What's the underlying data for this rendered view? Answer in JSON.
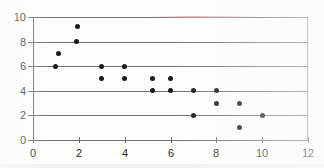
{
  "chart_data": {
    "type": "scatter",
    "title": "",
    "subtitle": "",
    "xlabel": "",
    "ylabel": "",
    "xlim": [
      0,
      12
    ],
    "ylim": [
      0,
      10
    ],
    "grid": true,
    "legend": null,
    "x_ticks": [
      0,
      2,
      4,
      6,
      8,
      10,
      12
    ],
    "y_ticks": [
      0,
      2,
      4,
      6,
      8,
      10
    ],
    "x_tick_labels": [
      "0",
      "2",
      "4",
      "6",
      "8",
      "10",
      "12"
    ],
    "y_tick_labels": [
      "0",
      "2",
      "4",
      "6",
      "8",
      "10"
    ],
    "gridlines_y": [
      0,
      2,
      4,
      6,
      8,
      10
    ],
    "marker": {
      "shape": "circle",
      "color": "#1b1b1b",
      "size": 5
    },
    "points": [
      {
        "x": 1.0,
        "y": 6.0
      },
      {
        "x": 1.1,
        "y": 7.0
      },
      {
        "x": 1.9,
        "y": 8.0
      },
      {
        "x": 1.95,
        "y": 9.2
      },
      {
        "x": 3.0,
        "y": 6.0
      },
      {
        "x": 3.0,
        "y": 5.0
      },
      {
        "x": 4.0,
        "y": 6.0
      },
      {
        "x": 4.0,
        "y": 5.0
      },
      {
        "x": 5.2,
        "y": 5.0
      },
      {
        "x": 5.2,
        "y": 4.0
      },
      {
        "x": 6.0,
        "y": 5.0
      },
      {
        "x": 6.0,
        "y": 4.0
      },
      {
        "x": 7.0,
        "y": 4.0
      },
      {
        "x": 7.0,
        "y": 2.0
      },
      {
        "x": 8.0,
        "y": 4.0
      },
      {
        "x": 8.0,
        "y": 3.0
      },
      {
        "x": 9.0,
        "y": 3.0
      },
      {
        "x": 9.0,
        "y": 1.0
      },
      {
        "x": 10.0,
        "y": 2.0
      }
    ],
    "colors": {
      "marker": "#1b1b1b",
      "axis": "#6e7376",
      "gridline": "#6e7376",
      "frame": "#8d9194",
      "background": "#fdfdfc",
      "tick_label": "#2b2b2b"
    }
  }
}
